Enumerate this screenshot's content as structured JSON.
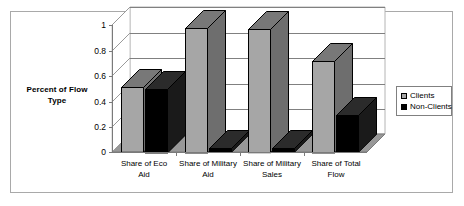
{
  "chart_data": {
    "type": "bar",
    "title": "",
    "xlabel": "",
    "ylabel": "Percent of Flow Type",
    "ylim": [
      0,
      1
    ],
    "ytick_labels": [
      "0",
      "0.2",
      "0.4",
      "0.6",
      "0.8",
      "1"
    ],
    "ytick_values": [
      0,
      0.2,
      0.4,
      0.6,
      0.8,
      1
    ],
    "grid": true,
    "legend_position": "right",
    "three_d": true,
    "categories": [
      "Share of Eco Aid",
      "Share of Military Aid",
      "Share of Military Sales",
      "Share of Total Flow"
    ],
    "category_lines": [
      [
        "Share of Eco",
        "Aid"
      ],
      [
        "Share of Military",
        "Aid"
      ],
      [
        "Share of Military",
        "Sales"
      ],
      [
        "Share of Total",
        "Flow"
      ]
    ],
    "series": [
      {
        "name": "Clients",
        "color": "#a6a6a6",
        "values": [
          0.51,
          0.98,
          0.97,
          0.72
        ]
      },
      {
        "name": "Non-Clients",
        "color": "#000000",
        "values": [
          0.5,
          0.03,
          0.03,
          0.29
        ]
      }
    ]
  },
  "legend": {
    "items": [
      {
        "label": "Clients",
        "swatch": "clients-swatch"
      },
      {
        "label": "Non-Clients",
        "swatch": "non-clients-swatch"
      }
    ]
  },
  "axis": {
    "y_title_line1": "Percent of Flow",
    "y_title_line2": "Type"
  }
}
